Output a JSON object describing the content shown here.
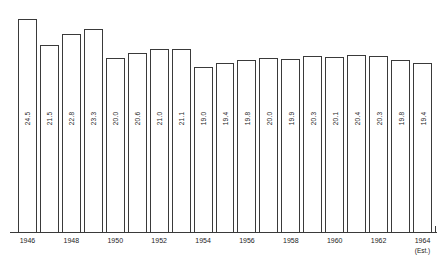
{
  "chart_data": {
    "type": "bar",
    "title": "",
    "subtitle": "",
    "xlabel": "",
    "ylabel": "",
    "ylim": [
      0,
      26
    ],
    "grid": false,
    "legend": null,
    "categories": [
      "1946",
      "1947",
      "1948",
      "1949",
      "1950",
      "1951",
      "1952",
      "1953",
      "1954",
      "1955",
      "1956",
      "1957",
      "1958",
      "1959",
      "1960",
      "1961",
      "1962",
      "1963",
      "1964"
    ],
    "values": [
      24.5,
      21.5,
      22.8,
      23.3,
      20.0,
      20.6,
      21.0,
      21.1,
      19.0,
      19.4,
      19.8,
      20.0,
      19.9,
      20.3,
      20.1,
      20.4,
      20.3,
      19.8,
      19.4
    ],
    "value_labels": [
      "24.5",
      "21.5",
      "22.8",
      "23.3",
      "20.0",
      "20.6",
      "21.0",
      "21.1",
      "19.0",
      "19.4",
      "19.8",
      "20.0",
      "19.9",
      "20.3",
      "20.1",
      "20.4",
      "20.3",
      "19.8",
      "19.4"
    ],
    "tick_labels": [
      "1946",
      "1948",
      "1950",
      "1952",
      "1954",
      "1956",
      "1958",
      "1960",
      "1962",
      "1964"
    ],
    "tick_label_indices": [
      0,
      2,
      4,
      6,
      8,
      10,
      12,
      14,
      16,
      18
    ],
    "annotations": [
      {
        "text": "(Est.)",
        "attached_to": "1964"
      }
    ],
    "colors": {
      "bar_fill": "#ffffff",
      "bar_stroke": "#3a3a3a",
      "text": "#1d1d1d",
      "background": "#ffffff"
    }
  }
}
